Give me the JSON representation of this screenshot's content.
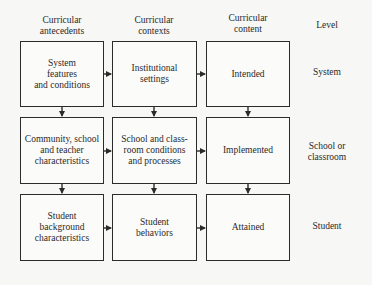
{
  "headers": {
    "antecedents": "Curricular\nantecedents",
    "contexts": "Curricular\ncontexts",
    "content": "Curricular\ncontent",
    "level": "Level"
  },
  "rows": [
    {
      "antecedent": "System\nfeatures\nand conditions",
      "context": "Institutional\nsettings",
      "content": "Intended",
      "level": "System"
    },
    {
      "antecedent": "Community, school\nand teacher\ncharacteristics",
      "context": "School and class-\nroom conditions\nand processes",
      "content": "Implemented",
      "level": "School or\nclassroom"
    },
    {
      "antecedent": "Student\nbackground\ncharacteristics",
      "context": "Student\nbehaviors",
      "content": "Attained",
      "level": "Student"
    }
  ],
  "colors": {
    "line": "#2b2b2b",
    "background": "#f7f7f5"
  }
}
